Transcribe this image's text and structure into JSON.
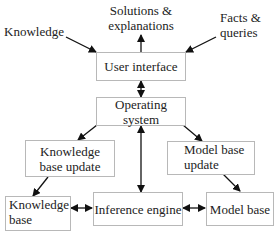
{
  "diagram": {
    "external_inputs": {
      "knowledge": "Knowledge",
      "solutions": "Solutions & explanations",
      "solutions_line1": "Solutions &",
      "solutions_line2": "explanations",
      "facts_line1": "Facts &",
      "facts_line2": "queries"
    },
    "nodes": {
      "user_interface": "User interface",
      "operating_system": "Operating system",
      "kb_update_line1": "Knowledge",
      "kb_update_line2": "base update",
      "mb_update_line1": "Model base",
      "mb_update_line2": "update",
      "kb_line1": "Knowledge",
      "kb_line2": "base",
      "inference_engine": "Inference engine",
      "model_base": "Model base"
    },
    "edges": [
      {
        "from": "Knowledge",
        "to": "User interface",
        "type": "single"
      },
      {
        "from": "User interface",
        "to": "Solutions & explanations",
        "type": "single"
      },
      {
        "from": "Facts & queries",
        "to": "User interface",
        "type": "single"
      },
      {
        "from": "User interface",
        "to": "Operating system",
        "type": "double"
      },
      {
        "from": "Operating system",
        "to": "Knowledge base update",
        "type": "single"
      },
      {
        "from": "Operating system",
        "to": "Model base update",
        "type": "single"
      },
      {
        "from": "Operating system",
        "to": "Inference engine",
        "type": "double"
      },
      {
        "from": "Knowledge base update",
        "to": "Knowledge base",
        "type": "single"
      },
      {
        "from": "Model base update",
        "to": "Model base",
        "type": "single"
      },
      {
        "from": "Knowledge base",
        "to": "Inference engine",
        "type": "double"
      },
      {
        "from": "Inference engine",
        "to": "Model base",
        "type": "double"
      }
    ]
  }
}
